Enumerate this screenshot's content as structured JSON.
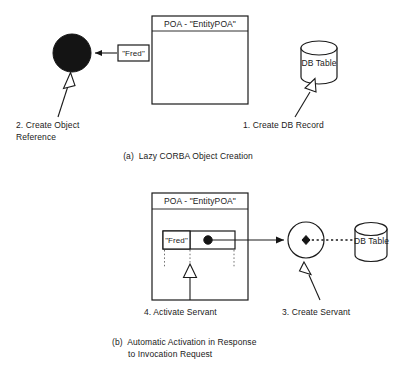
{
  "figure": {
    "type": "diagram",
    "background_color": "#ffffff",
    "line_color": "#1a1a1a"
  },
  "panel_a": {
    "caption": "(a)  Lazy CORBA Object Creation",
    "poa": {
      "title": "POA - \"EntityPOA\"",
      "body_empty": true
    },
    "object_reference": {
      "shape": "filled-circle",
      "fill": "#141414",
      "label": "\"Fred\"",
      "arrow_direction": "left"
    },
    "database": {
      "label": "DB Table",
      "shape": "cylinder"
    },
    "annotations": [
      {
        "id": "step-2",
        "line1": "2. Create Object",
        "line2": "Reference"
      },
      {
        "id": "step-1",
        "line1": "1. Create DB Record",
        "line2": ""
      }
    ]
  },
  "panel_b": {
    "caption_line1": "(b)  Automatic Activation in Response",
    "caption_line2": "to Invocation Request",
    "poa": {
      "title": "POA - \"EntityPOA\"",
      "table": {
        "cell_key": "\"Fred\"",
        "cell_value_marker": "filled-dot"
      }
    },
    "servant": {
      "shape": "hollow-circle",
      "marker": "filled-diamond"
    },
    "database": {
      "label": "DB Table",
      "shape": "cylinder"
    },
    "annotations": [
      {
        "id": "step-4",
        "line1": "4. Activate Servant",
        "line2": ""
      },
      {
        "id": "step-3",
        "line1": "3. Create Servant",
        "line2": ""
      }
    ]
  }
}
